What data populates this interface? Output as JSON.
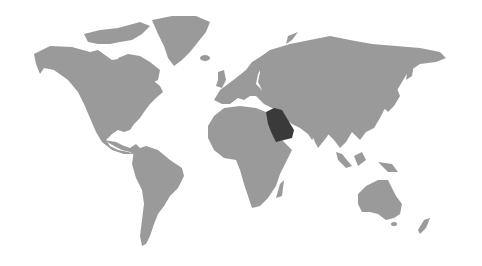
{
  "map": {
    "type": "world-choropleth",
    "projection": "miller-like",
    "highlighted_region": "Saudi Arabia",
    "colors": {
      "background": "#ffffff",
      "land": "#9a9a9a",
      "highlight": "#3a3a3a"
    },
    "regions": [
      {
        "name": "North America",
        "highlighted": false
      },
      {
        "name": "Greenland",
        "highlighted": false
      },
      {
        "name": "South America",
        "highlighted": false
      },
      {
        "name": "Europe",
        "highlighted": false
      },
      {
        "name": "Africa",
        "highlighted": false
      },
      {
        "name": "Asia",
        "highlighted": false
      },
      {
        "name": "Saudi Arabia",
        "highlighted": true
      },
      {
        "name": "Australia",
        "highlighted": false
      },
      {
        "name": "New Zealand",
        "highlighted": false
      }
    ]
  }
}
